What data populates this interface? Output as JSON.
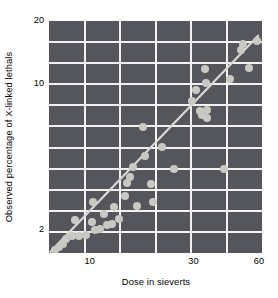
{
  "chart_data": {
    "type": "scatter",
    "title": "",
    "xlabel": "Dose in sieverts",
    "ylabel": "Observed percentage of X-linked lethals",
    "xscale": "log",
    "yscale": "log",
    "xlim": [
      6.5,
      62
    ],
    "ylim": [
      1.55,
      20
    ],
    "xticks": [
      10,
      30,
      60
    ],
    "xticklabels": [
      "10",
      "30",
      "60"
    ],
    "yticks": [
      2,
      10,
      20
    ],
    "yticklabels": [
      "2",
      "10",
      "20"
    ],
    "grid": true,
    "legend": null,
    "colors": {
      "plot_background": "#55565b",
      "gridlines": "#f2f2f2",
      "points": "#c9c9c4",
      "fit_line": "#d8d8d4",
      "page_background": "#ffffff",
      "text": "#000000"
    },
    "points": [
      {
        "x": 6.9,
        "y": 1.6
      },
      {
        "x": 7.2,
        "y": 1.66
      },
      {
        "x": 7.5,
        "y": 1.72
      },
      {
        "x": 7.8,
        "y": 1.8
      },
      {
        "x": 8.3,
        "y": 1.86
      },
      {
        "x": 8.9,
        "y": 1.87
      },
      {
        "x": 8.6,
        "y": 2.22
      },
      {
        "x": 9.6,
        "y": 1.88
      },
      {
        "x": 10.4,
        "y": 2.72
      },
      {
        "x": 10.2,
        "y": 2.18
      },
      {
        "x": 10.6,
        "y": 1.99
      },
      {
        "x": 11.2,
        "y": 2.02
      },
      {
        "x": 11.6,
        "y": 2.39
      },
      {
        "x": 12.0,
        "y": 2.1
      },
      {
        "x": 12.6,
        "y": 2.14
      },
      {
        "x": 13.0,
        "y": 2.56
      },
      {
        "x": 13.6,
        "y": 2.26
      },
      {
        "x": 14.6,
        "y": 2.9
      },
      {
        "x": 14.9,
        "y": 3.35
      },
      {
        "x": 15.4,
        "y": 3.6
      },
      {
        "x": 15.8,
        "y": 4.0
      },
      {
        "x": 16.5,
        "y": 2.6
      },
      {
        "x": 17.6,
        "y": 6.2
      },
      {
        "x": 17.9,
        "y": 4.5
      },
      {
        "x": 19.2,
        "y": 3.3
      },
      {
        "x": 19.6,
        "y": 2.72
      },
      {
        "x": 21.6,
        "y": 5.0
      },
      {
        "x": 24.5,
        "y": 3.9
      },
      {
        "x": 29.5,
        "y": 8.3
      },
      {
        "x": 30.8,
        "y": 9.3
      },
      {
        "x": 32.0,
        "y": 7.4
      },
      {
        "x": 32.8,
        "y": 7.1
      },
      {
        "x": 34.0,
        "y": 11.8
      },
      {
        "x": 34.2,
        "y": 10.1
      },
      {
        "x": 34.6,
        "y": 7.5
      },
      {
        "x": 34.8,
        "y": 6.9
      },
      {
        "x": 41.5,
        "y": 3.9
      },
      {
        "x": 44.0,
        "y": 10.6
      },
      {
        "x": 49.5,
        "y": 14.6
      },
      {
        "x": 50.6,
        "y": 15.6
      },
      {
        "x": 54.0,
        "y": 11.9
      },
      {
        "x": 58.5,
        "y": 16.1
      }
    ],
    "fit_line": {
      "type": "power-law regression",
      "x_start": 6.6,
      "y_start": 1.57,
      "x_end": 59.5,
      "y_end": 17.0
    },
    "annotations": []
  }
}
